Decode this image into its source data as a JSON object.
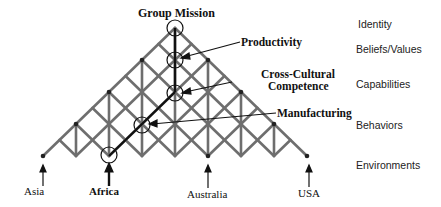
{
  "diagram": {
    "apex_label": "Group Mission",
    "callouts": [
      {
        "label": "Productivity"
      },
      {
        "label_line1": "Cross-Cultural",
        "label_line2": "Competence"
      },
      {
        "label": "Manufacturing"
      }
    ],
    "levels": [
      "Identity",
      "Beliefs/Values",
      "Capabilities",
      "Behaviors",
      "Environments"
    ],
    "environments": [
      {
        "label": "Asia",
        "bold": false
      },
      {
        "label": "Africa",
        "bold": true
      },
      {
        "label": "Australia",
        "bold": false
      },
      {
        "label": "USA",
        "bold": false
      }
    ],
    "colors": {
      "lattice": "#6e6e6e",
      "highlight": "#111111",
      "node": "#222222"
    }
  }
}
